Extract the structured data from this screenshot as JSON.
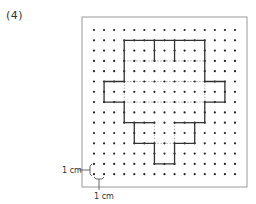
{
  "problem": {
    "label": "(4)"
  },
  "grid": {
    "columns": 15,
    "rows": 15,
    "origin_x": 94,
    "origin_y": 30,
    "step_x": 10.07,
    "step_y": 10.3,
    "dot_color": "#222222",
    "frame": {
      "x": 82,
      "y": 17,
      "width": 165,
      "height": 170,
      "color": "#9a9a9a"
    }
  },
  "figure": {
    "outline_color": "#333333",
    "dashed_color": "#999999",
    "outline": [
      [
        3,
        1
      ],
      [
        11,
        1
      ],
      [
        11,
        5
      ],
      [
        13,
        5
      ],
      [
        13,
        7
      ],
      [
        11,
        7
      ],
      [
        11,
        9
      ],
      [
        10,
        9
      ],
      [
        10,
        11
      ],
      [
        8,
        11
      ],
      [
        8,
        13
      ],
      [
        6,
        13
      ],
      [
        6,
        11
      ],
      [
        4,
        11
      ],
      [
        4,
        9
      ],
      [
        3,
        9
      ],
      [
        3,
        7
      ],
      [
        1,
        7
      ],
      [
        1,
        5
      ],
      [
        3,
        5
      ],
      [
        3,
        1
      ]
    ],
    "solid_segments": [
      [
        [
          6,
          1
        ],
        [
          6,
          3
        ]
      ],
      [
        [
          8,
          1
        ],
        [
          8,
          3
        ]
      ],
      [
        [
          4,
          9
        ],
        [
          6,
          9
        ]
      ],
      [
        [
          8,
          9
        ],
        [
          10,
          9
        ]
      ]
    ],
    "dashed_segments": [
      [
        [
          3,
          3
        ],
        [
          11,
          3
        ]
      ],
      [
        [
          3,
          5
        ],
        [
          11,
          5
        ]
      ],
      [
        [
          3,
          7
        ],
        [
          11,
          7
        ]
      ],
      [
        [
          3,
          5
        ],
        [
          3,
          7
        ]
      ],
      [
        [
          11,
          5
        ],
        [
          11,
          7
        ]
      ],
      [
        [
          6,
          9
        ],
        [
          6,
          11
        ]
      ],
      [
        [
          8,
          9
        ],
        [
          8,
          11
        ]
      ],
      [
        [
          6,
          11
        ],
        [
          8,
          11
        ]
      ]
    ]
  },
  "scale": {
    "vertical_label": "1 cm",
    "horizontal_label": "1 cm"
  }
}
